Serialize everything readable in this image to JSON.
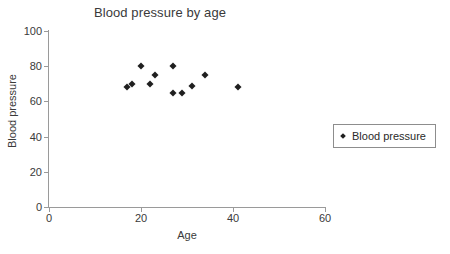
{
  "chart_data": {
    "type": "scatter",
    "title": "Blood pressure by age",
    "xlabel": "Age",
    "ylabel": "Blood pressure",
    "xlim": [
      0,
      60
    ],
    "ylim": [
      0,
      100
    ],
    "xticks": [
      0,
      20,
      40,
      60
    ],
    "yticks": [
      0,
      20,
      40,
      60,
      80,
      100
    ],
    "grid": false,
    "legend_position": "right",
    "marker": "diamond",
    "marker_color": "#1f1f1f",
    "axis_color": "#9a9a9a",
    "series": [
      {
        "name": "Blood pressure",
        "x": [
          17,
          18,
          20,
          22,
          23,
          27,
          27,
          29,
          31,
          34,
          41
        ],
        "y": [
          68,
          70,
          80,
          70,
          75,
          80,
          65,
          65,
          69,
          75,
          68
        ]
      }
    ]
  },
  "legend": {
    "entries": [
      {
        "label": "Blood pressure"
      }
    ]
  }
}
